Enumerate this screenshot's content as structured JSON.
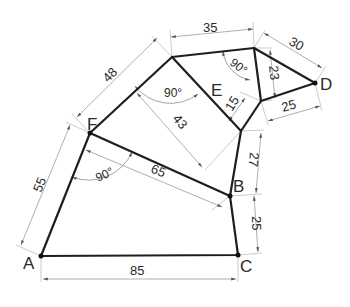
{
  "diagram": {
    "type": "geometric-construction-drawing",
    "colors": {
      "edge": "#1e1e1e",
      "dimension": "#9a9a9a",
      "text": "#2a2a2a"
    },
    "vertices": [
      {
        "id": "A",
        "label": "A"
      },
      {
        "id": "B",
        "label": "B"
      },
      {
        "id": "C",
        "label": "C"
      },
      {
        "id": "D",
        "label": "D"
      },
      {
        "id": "E",
        "label": "E"
      },
      {
        "id": "F",
        "label": "F"
      }
    ],
    "edges": [
      {
        "from": "A",
        "to": "C"
      },
      {
        "from": "C",
        "to": "B"
      },
      {
        "from": "B",
        "to": "F"
      },
      {
        "from": "F",
        "to": "A"
      },
      {
        "from": "F",
        "to": "G"
      },
      {
        "from": "G",
        "to": "H"
      },
      {
        "from": "G",
        "to": "J"
      },
      {
        "from": "J",
        "to": "B"
      },
      {
        "from": "J",
        "to": "I"
      },
      {
        "from": "H",
        "to": "I"
      },
      {
        "from": "H",
        "to": "D"
      },
      {
        "from": "I",
        "to": "D"
      }
    ],
    "dimensions": [
      {
        "id": "AC",
        "label": "85"
      },
      {
        "id": "CB",
        "label": "25"
      },
      {
        "id": "BJ",
        "label": "27"
      },
      {
        "id": "AF",
        "label": "55"
      },
      {
        "id": "FB",
        "label": "65"
      },
      {
        "id": "FG",
        "label": "48"
      },
      {
        "id": "perp",
        "label": "43"
      },
      {
        "id": "GH",
        "label": "35"
      },
      {
        "id": "HD",
        "label": "30"
      },
      {
        "id": "HI",
        "label": "23"
      },
      {
        "id": "ID",
        "label": "25"
      },
      {
        "id": "EJ",
        "label": "15"
      }
    ],
    "angles": [
      {
        "id": "angle-F",
        "label": "90°"
      },
      {
        "id": "angle-G",
        "label": "90°"
      },
      {
        "id": "angle-H",
        "label": "90°"
      }
    ]
  }
}
